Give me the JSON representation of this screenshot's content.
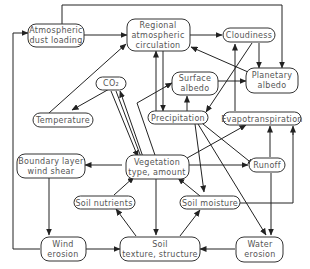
{
  "diagram": {
    "type": "flowchart",
    "nodes": {
      "dust": {
        "lines": [
          "Atmospheric",
          "dust loading"
        ]
      },
      "regional": {
        "lines": [
          "Regional",
          "atmospheric",
          "circulation"
        ]
      },
      "cloud": {
        "lines": [
          "Cloudiness"
        ]
      },
      "co2": {
        "lines": [
          "CO₂"
        ]
      },
      "surface": {
        "lines": [
          "Surface",
          "albedo"
        ]
      },
      "planetary": {
        "lines": [
          "Planetary",
          "albedo"
        ]
      },
      "temp": {
        "lines": [
          "Temperature"
        ]
      },
      "precip": {
        "lines": [
          "Precipitation"
        ]
      },
      "evapo": {
        "lines": [
          "Evapotranspiration"
        ]
      },
      "boundary": {
        "lines": [
          "Boundary layer",
          "wind shear"
        ]
      },
      "veg": {
        "lines": [
          "Vegetation",
          "type, amount"
        ]
      },
      "runoff": {
        "lines": [
          "Runoff"
        ]
      },
      "nutrients": {
        "lines": [
          "Soil nutrients"
        ]
      },
      "moisture": {
        "lines": [
          "Soil moisture"
        ]
      },
      "wind": {
        "lines": [
          "Wind",
          "erosion"
        ]
      },
      "soil": {
        "lines": [
          "Soil",
          "texture, structure"
        ]
      },
      "water": {
        "lines": [
          "Water",
          "erosion"
        ]
      }
    },
    "edges": [
      [
        "dust",
        "regional"
      ],
      [
        "dust",
        "planetary"
      ],
      [
        "regional",
        "cloud"
      ],
      [
        "regional",
        "precip"
      ],
      [
        "precip",
        "regional"
      ],
      [
        "planetary",
        "regional"
      ],
      [
        "cloud",
        "planetary"
      ],
      [
        "cloud",
        "precip"
      ],
      [
        "evapo",
        "cloud"
      ],
      [
        "surface",
        "planetary"
      ],
      [
        "precip",
        "surface"
      ],
      [
        "veg",
        "surface"
      ],
      [
        "temp",
        "regional"
      ],
      [
        "co2",
        "temp"
      ],
      [
        "co2",
        "veg"
      ],
      [
        "veg",
        "co2"
      ],
      [
        "precip",
        "veg"
      ],
      [
        "veg",
        "evapo"
      ],
      [
        "precip",
        "runoff"
      ],
      [
        "precip",
        "moisture"
      ],
      [
        "precip",
        "water"
      ],
      [
        "veg",
        "runoff"
      ],
      [
        "veg",
        "boundary"
      ],
      [
        "boundary",
        "wind"
      ],
      [
        "wind",
        "dust"
      ],
      [
        "wind",
        "soil"
      ],
      [
        "soil",
        "nutrients"
      ],
      [
        "nutrients",
        "veg"
      ],
      [
        "soil",
        "moisture"
      ],
      [
        "moisture",
        "veg"
      ],
      [
        "moisture",
        "evapo"
      ],
      [
        "runoff",
        "water"
      ],
      [
        "water",
        "soil"
      ],
      [
        "veg",
        "soil"
      ],
      [
        "runoff",
        "evapo"
      ]
    ]
  }
}
